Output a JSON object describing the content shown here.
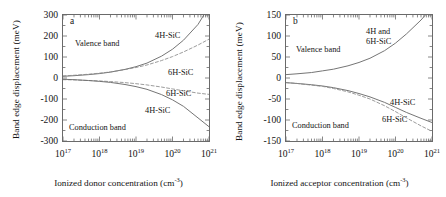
{
  "figure": {
    "panels": [
      {
        "id": "a",
        "letter": "a",
        "ylabel": "Band edge displacement (meV)",
        "xlabel_text": "Ionized donor concentration (cm",
        "xlabel_sup": "-3",
        "xlabel_tail": ")",
        "yticks": [
          "300",
          "200",
          "100",
          "0",
          "-100",
          "-200",
          "-300"
        ],
        "yvalues": [
          300,
          200,
          100,
          0,
          -100,
          -200,
          -300
        ],
        "xticks": [
          {
            "mantissa": "10",
            "exponent": "17"
          },
          {
            "mantissa": "10",
            "exponent": "18"
          },
          {
            "mantissa": "10",
            "exponent": "19"
          },
          {
            "mantissa": "10",
            "exponent": "20"
          },
          {
            "mantissa": "10",
            "exponent": "21"
          }
        ],
        "annotations": [
          {
            "name": "valence-band-label",
            "text": "Valence band",
            "x": 12,
            "y": 24
          },
          {
            "name": "conduction-band-label",
            "text": "Conduction band",
            "x": 6,
            "y": 108
          },
          {
            "name": "valence-4h-sic-label",
            "text": "4H-SiC",
            "x": 92,
            "y": 16
          },
          {
            "name": "valence-6h-sic-label",
            "text": "6H-SiC",
            "x": 105,
            "y": 53
          },
          {
            "name": "conduction-6h-sic-label",
            "text": "6H-SiC",
            "x": 103,
            "y": 74
          },
          {
            "name": "conduction-4h-sic-label",
            "text": "4H-SiC",
            "x": 82,
            "y": 91
          }
        ]
      },
      {
        "id": "b",
        "letter": "b",
        "ylabel": "Band edge displacement (meV)",
        "xlabel_text": "Ionized acceptor concentration (cm",
        "xlabel_sup": "-3",
        "xlabel_tail": ")",
        "yticks": [
          "150",
          "100",
          "50",
          "0",
          "-50",
          "-100",
          "-150"
        ],
        "yvalues": [
          150,
          100,
          50,
          0,
          -50,
          -100,
          -150
        ],
        "xticks": [
          {
            "mantissa": "10",
            "exponent": "17"
          },
          {
            "mantissa": "10",
            "exponent": "18"
          },
          {
            "mantissa": "10",
            "exponent": "19"
          },
          {
            "mantissa": "10",
            "exponent": "20"
          },
          {
            "mantissa": "10",
            "exponent": "21"
          }
        ],
        "annotations": [
          {
            "name": "valence-band-label",
            "text": "Valence band",
            "x": 10,
            "y": 30
          },
          {
            "name": "conduction-band-label",
            "text": "Conduction band",
            "x": 6,
            "y": 106
          },
          {
            "name": "valence-combined-label-line1",
            "text": "4H and",
            "x": 80,
            "y": 12
          },
          {
            "name": "valence-combined-label-line2",
            "text": "6H-SiC",
            "x": 80,
            "y": 22
          },
          {
            "name": "conduction-4h-sic-label",
            "text": "4H-SiC",
            "x": 104,
            "y": 83
          },
          {
            "name": "conduction-6h-sic-label",
            "text": "6H-SiC",
            "x": 96,
            "y": 100
          }
        ]
      }
    ]
  },
  "chart_data": [
    {
      "type": "line",
      "panel": "a",
      "title": "(a) Band edge displacement vs ionized donor concentration",
      "xlabel": "Ionized donor concentration (cm^-3)",
      "ylabel": "Band edge displacement (meV)",
      "xscale": "log",
      "xlim": [
        1e+17,
        1e+21
      ],
      "ylim": [
        -300,
        300
      ],
      "xticks": [
        1e+17,
        1e+18,
        1e+19,
        1e+20,
        1e+21
      ],
      "yticks": [
        -300,
        -200,
        -100,
        0,
        100,
        200,
        300
      ],
      "grid": false,
      "legend": "inline-annotations",
      "x": [
        1e+17,
        2e+17,
        5e+17,
        1e+18,
        2e+18,
        5e+18,
        1e+19,
        2e+19,
        5e+19,
        1e+20,
        2e+20,
        5e+20,
        1e+21
      ],
      "series": [
        {
          "name": "Valence band 4H-SiC",
          "style": "solid",
          "color": "#6e6e6e",
          "values": [
            8,
            11,
            16,
            21,
            28,
            41,
            54,
            71,
            104,
            137,
            180,
            255,
            340
          ]
        },
        {
          "name": "Valence band 6H-SiC",
          "style": "dashed",
          "color": "#8a8a8a",
          "values": [
            10,
            13,
            18,
            23,
            29,
            40,
            50,
            62,
            83,
            102,
            124,
            157,
            185
          ]
        },
        {
          "name": "Conduction band 6H-SiC",
          "style": "dashed",
          "color": "#8a8a8a",
          "values": [
            -8,
            -9,
            -12,
            -14,
            -17,
            -22,
            -27,
            -33,
            -43,
            -52,
            -61,
            -72,
            -78
          ]
        },
        {
          "name": "Conduction band 4H-SiC",
          "style": "solid",
          "color": "#6e6e6e",
          "values": [
            -6,
            -8,
            -12,
            -16,
            -21,
            -31,
            -41,
            -54,
            -79,
            -104,
            -135,
            -190,
            -232
          ]
        }
      ]
    },
    {
      "type": "line",
      "panel": "b",
      "title": "(b) Band edge displacement vs ionized acceptor concentration",
      "xlabel": "Ionized acceptor concentration (cm^-3)",
      "ylabel": "Band edge displacement (meV)",
      "xscale": "log",
      "xlim": [
        1e+17,
        1e+21
      ],
      "ylim": [
        -150,
        150
      ],
      "xticks": [
        1e+17,
        1e+18,
        1e+19,
        1e+20,
        1e+21
      ],
      "yticks": [
        -150,
        -100,
        -50,
        0,
        50,
        100,
        150
      ],
      "grid": false,
      "legend": "inline-annotations",
      "x": [
        1e+17,
        2e+17,
        5e+17,
        1e+18,
        2e+18,
        5e+18,
        1e+19,
        2e+19,
        5e+19,
        1e+20,
        2e+20,
        5e+20,
        1e+21
      ],
      "series": [
        {
          "name": "Valence band 4H and 6H-SiC",
          "style": "solid",
          "color": "#6e6e6e",
          "values": [
            8,
            10,
            13,
            17,
            21,
            29,
            37,
            47,
            65,
            83,
            105,
            138,
            168
          ]
        },
        {
          "name": "Conduction band 4H-SiC",
          "style": "solid",
          "color": "#6e6e6e",
          "values": [
            -11,
            -13,
            -16,
            -19,
            -23,
            -30,
            -37,
            -45,
            -58,
            -70,
            -82,
            -96,
            -106
          ]
        },
        {
          "name": "Conduction band 6H-SiC",
          "style": "dashed",
          "color": "#8a8a8a",
          "values": [
            -11,
            -13,
            -17,
            -20,
            -25,
            -33,
            -41,
            -50,
            -66,
            -80,
            -95,
            -114,
            -127
          ]
        }
      ]
    }
  ]
}
